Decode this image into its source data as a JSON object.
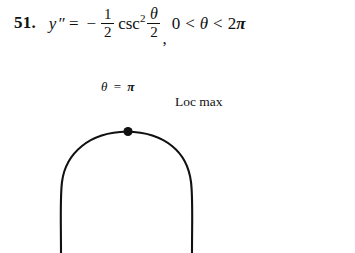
{
  "page": {
    "background_color": "#ffffff",
    "ink_color": "#111111"
  },
  "problem": {
    "number": "51.",
    "equation": {
      "lhs_variable": "y",
      "lhs_primes": "″",
      "equals": "=",
      "minus": "−",
      "coefficient_fraction": {
        "numerator": "1",
        "denominator": "2"
      },
      "function_name": "csc",
      "function_exponent": "2",
      "argument_fraction": {
        "numerator": "θ",
        "denominator": "2"
      },
      "comma": ",",
      "domain": {
        "lower_bound": "0",
        "less_than_1": "<",
        "variable": "θ",
        "less_than_2": "<",
        "upper_bound_coefficient": "2",
        "upper_bound_symbol": "π"
      },
      "plain_text": "y'' = -1/2 csc^2 (θ/2), 0 < θ < 2π"
    }
  },
  "figure": {
    "type": "curve-sketch",
    "point_label": {
      "variable": "θ",
      "equals": "=",
      "value": "π",
      "plain_text": "θ = π"
    },
    "annotation_label": "Loc max",
    "critical_point": {
      "x_label": "θ = π",
      "kind": "local maximum"
    },
    "curve_description": "concave-down arch, apex at θ = π, branches falling steeply toward the vertical asymptotes at θ = 0 and θ = 2π",
    "dot_marker": "filled-dot"
  }
}
